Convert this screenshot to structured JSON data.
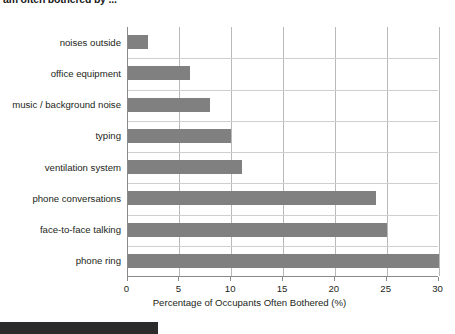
{
  "heading": {
    "text": "am often bothered by ...",
    "note": "clipped at top edge of screenshot"
  },
  "caption": {
    "text": "",
    "note": "dark highlighted strip clipped at bottom edge; text not legible"
  },
  "colors": {
    "bar": "#808080",
    "gridline": "#b9b9b9",
    "axis": "#8a8a8a",
    "text": "#231f20",
    "background": "#ffffff",
    "caption_strip": "#2b2b2b"
  },
  "chart_data": {
    "type": "bar",
    "orientation": "horizontal",
    "title": "am often bothered by ...",
    "xlabel": "Percentage of Occupants Often Bothered (%)",
    "ylabel": "",
    "xlim": [
      0,
      30
    ],
    "xticks": [
      0,
      5,
      10,
      15,
      20,
      25,
      30
    ],
    "grid": "vertical",
    "legend": "none",
    "categories": [
      "noises outside",
      "office equipment",
      "music / background noise",
      "typing",
      "ventilation system",
      "phone conversations",
      "face-to-face talking",
      "phone ring"
    ],
    "values": [
      2,
      6,
      8,
      10,
      11,
      24,
      25,
      30
    ],
    "units": "%"
  }
}
